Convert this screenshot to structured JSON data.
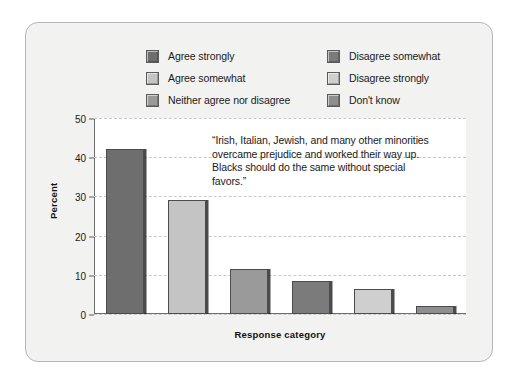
{
  "chart_data": {
    "type": "bar",
    "title": "",
    "subtitle": "",
    "xlabel": "Response category",
    "ylabel": "Percent",
    "ylim": [
      0,
      50
    ],
    "yticks": [
      0,
      10,
      20,
      30,
      40,
      50
    ],
    "ytick_labels": [
      "0",
      "10",
      "20",
      "30",
      "40",
      "50"
    ],
    "grid": true,
    "legend_position": "top-center",
    "categories": [
      "Agree strongly",
      "Agree somewhat",
      "Neither agree nor disagree",
      "Disagree somewhat",
      "Disagree strongly",
      "Don't know"
    ],
    "values": [
      42,
      29,
      11.5,
      8.5,
      6.3,
      2.1
    ],
    "colors": [
      "#6e6e6e",
      "#c4c4c4",
      "#9a9a9a",
      "#7b7b7b",
      "#cfcfcf",
      "#8e8e8e"
    ],
    "annotation": "“Irish, Italian, Jewish, and many other minorities overcame prejudice and worked their way up. Blacks should do the same without special favors.”"
  },
  "legend": {
    "left_column": [
      {
        "label": "Agree strongly",
        "color": "#6e6e6e"
      },
      {
        "label": "Agree somewhat",
        "color": "#c4c4c4"
      },
      {
        "label": "Neither agree nor disagree",
        "color": "#9a9a9a"
      }
    ],
    "right_column": [
      {
        "label": "Disagree somewhat",
        "color": "#7b7b7b"
      },
      {
        "label": "Disagree strongly",
        "color": "#cfcfcf"
      },
      {
        "label": "Don't know",
        "color": "#8e8e8e"
      }
    ]
  },
  "axes": {
    "y_title": "Percent",
    "x_title": "Response category",
    "tick_0": "0",
    "tick_1": "10",
    "tick_2": "20",
    "tick_3": "30",
    "tick_4": "40",
    "tick_5": "50"
  },
  "annotation": {
    "text": "“Irish, Italian, Jewish, and many other minorities overcame prejudice and worked their way up. Blacks should do the same without special favors.”"
  },
  "style": {
    "card_background": "#f2f2f0",
    "card_border": "#b6b6b6",
    "plot_background": "#ffffff",
    "grid_color": "#c9c9c9",
    "axis_color": "#6e6e6e",
    "text_color": "#1a1a1a"
  }
}
